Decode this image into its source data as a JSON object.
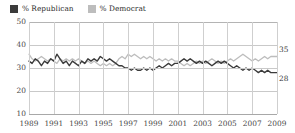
{
  "legend": {
    "items": [
      {
        "label": "% Republican",
        "color": "#3b3b3b"
      },
      {
        "label": "% Democrat",
        "color": "#bdbdbd"
      }
    ]
  },
  "axes": {
    "y_ticks": [
      "50",
      "40",
      "30",
      "20",
      "10"
    ],
    "x_ticks": [
      "1989",
      "1991",
      "1993",
      "1995",
      "1997",
      "1999",
      "2001",
      "2003",
      "2005",
      "2007",
      "2009"
    ]
  },
  "end_labels": {
    "democrat": "35",
    "republican": "28"
  },
  "chart_data": {
    "type": "line",
    "title": "",
    "xlabel": "",
    "ylabel": "",
    "xlim": [
      1989,
      2009
    ],
    "ylim": [
      10,
      50
    ],
    "grid": true,
    "legend_position": "top-left",
    "y_ticks": [
      10,
      20,
      30,
      40,
      50
    ],
    "x_ticks": [
      1989,
      1991,
      1993,
      1995,
      1997,
      1999,
      2001,
      2003,
      2005,
      2007,
      2009
    ],
    "annotations": [
      {
        "text": "35",
        "series": "% Democrat",
        "x": 2009,
        "y": 35
      },
      {
        "text": "28",
        "series": "% Republican",
        "x": 2009,
        "y": 28
      }
    ],
    "series": [
      {
        "name": "% Republican",
        "color": "#3b3b3b",
        "x": [
          1989.0,
          1989.25,
          1989.5,
          1989.75,
          1990.0,
          1990.25,
          1990.5,
          1990.75,
          1991.0,
          1991.25,
          1991.5,
          1991.75,
          1992.0,
          1992.25,
          1992.5,
          1992.75,
          1993.0,
          1993.25,
          1993.5,
          1993.75,
          1994.0,
          1994.25,
          1994.5,
          1994.75,
          1995.0,
          1995.25,
          1995.5,
          1995.75,
          1996.0,
          1996.25,
          1996.5,
          1996.75,
          1997.0,
          1997.25,
          1997.5,
          1997.75,
          1998.0,
          1998.25,
          1998.5,
          1998.75,
          1999.0,
          1999.25,
          1999.5,
          1999.75,
          2000.0,
          2000.25,
          2000.5,
          2000.75,
          2001.0,
          2001.25,
          2001.5,
          2001.75,
          2002.0,
          2002.25,
          2002.5,
          2002.75,
          2003.0,
          2003.25,
          2003.5,
          2003.75,
          2004.0,
          2004.25,
          2004.5,
          2004.75,
          2005.0,
          2005.25,
          2005.5,
          2005.75,
          2006.0,
          2006.25,
          2006.5,
          2006.75,
          2007.0,
          2007.25,
          2007.5,
          2007.75,
          2008.0,
          2008.25,
          2008.5,
          2008.75,
          2009.0
        ],
        "y": [
          33,
          32,
          34,
          33,
          31,
          33,
          32,
          34,
          33,
          36,
          34,
          32,
          33,
          31,
          33,
          32,
          31,
          33,
          32,
          34,
          33,
          34,
          33,
          35,
          34,
          33,
          34,
          33,
          32,
          31,
          31,
          30,
          30,
          29,
          30,
          29,
          29,
          30,
          29,
          30,
          29,
          30,
          31,
          30,
          31,
          32,
          31,
          32,
          32,
          33,
          34,
          33,
          34,
          33,
          32,
          33,
          32,
          33,
          32,
          31,
          32,
          33,
          32,
          33,
          32,
          31,
          30,
          31,
          30,
          29,
          30,
          29,
          30,
          29,
          28,
          29,
          28,
          29,
          28,
          28,
          28
        ]
      },
      {
        "name": "% Democrat",
        "color": "#bdbdbd",
        "x": [
          1989.0,
          1989.25,
          1989.5,
          1989.75,
          1990.0,
          1990.25,
          1990.5,
          1990.75,
          1991.0,
          1991.25,
          1991.5,
          1991.75,
          1992.0,
          1992.25,
          1992.5,
          1992.75,
          1993.0,
          1993.25,
          1993.5,
          1993.75,
          1994.0,
          1994.25,
          1994.5,
          1994.75,
          1995.0,
          1995.25,
          1995.5,
          1995.75,
          1996.0,
          1996.25,
          1996.5,
          1996.75,
          1997.0,
          1997.25,
          1997.5,
          1997.75,
          1998.0,
          1998.25,
          1998.5,
          1998.75,
          1999.0,
          1999.25,
          1999.5,
          1999.75,
          2000.0,
          2000.25,
          2000.5,
          2000.75,
          2001.0,
          2001.25,
          2001.5,
          2001.75,
          2002.0,
          2002.25,
          2002.5,
          2002.75,
          2003.0,
          2003.25,
          2003.5,
          2003.75,
          2004.0,
          2004.25,
          2004.5,
          2004.75,
          2005.0,
          2005.25,
          2005.5,
          2005.75,
          2006.0,
          2006.25,
          2006.5,
          2006.75,
          2007.0,
          2007.25,
          2007.5,
          2007.75,
          2008.0,
          2008.25,
          2008.5,
          2008.75,
          2009.0
        ],
        "y": [
          36,
          34,
          33,
          34,
          35,
          34,
          33,
          34,
          33,
          32,
          34,
          33,
          34,
          33,
          34,
          33,
          34,
          33,
          32,
          33,
          32,
          33,
          32,
          31,
          32,
          31,
          32,
          31,
          32,
          34,
          35,
          34,
          36,
          35,
          36,
          35,
          34,
          35,
          34,
          35,
          34,
          33,
          34,
          33,
          34,
          33,
          34,
          33,
          33,
          32,
          31,
          32,
          31,
          32,
          33,
          32,
          33,
          32,
          33,
          34,
          33,
          32,
          33,
          32,
          33,
          34,
          33,
          34,
          35,
          36,
          35,
          34,
          33,
          34,
          33,
          34,
          35,
          34,
          35,
          35,
          35
        ]
      }
    ]
  }
}
